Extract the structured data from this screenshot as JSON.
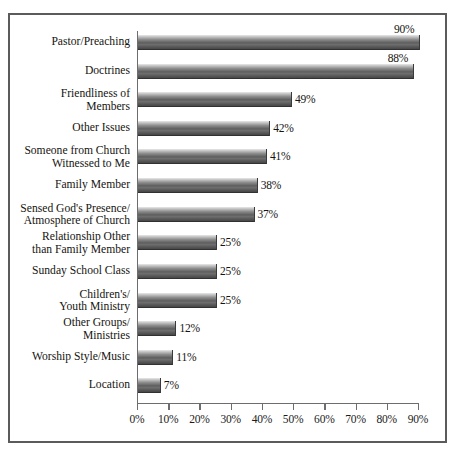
{
  "chart_data": {
    "type": "bar",
    "orientation": "horizontal",
    "title": "",
    "subtitle": "",
    "xlabel": "",
    "ylabel": "",
    "xlim": [
      0,
      90
    ],
    "xticks": [
      0,
      10,
      20,
      30,
      40,
      50,
      60,
      70,
      80,
      90
    ],
    "xticklabels": [
      "0%",
      "10%",
      "20%",
      "30%",
      "40%",
      "50%",
      "60%",
      "70%",
      "80%",
      "90%"
    ],
    "grid": false,
    "legend": null,
    "value_suffix": "%",
    "categories": [
      "Pastor/Preaching",
      "Doctrines",
      "Friendliness of\nMembers",
      "Other Issues",
      "Someone from Church\nWitnessed to Me",
      "Family Member",
      "Sensed God's Presence/\nAtmosphere of Church",
      "Relationship Other\nthan Family Member",
      "Sunday School Class",
      "Children's/\nYouth Ministry",
      "Other Groups/\nMinistries",
      "Worship Style/Music",
      "Location"
    ],
    "values": [
      90,
      88,
      49,
      42,
      41,
      38,
      37,
      25,
      25,
      25,
      12,
      11,
      7
    ],
    "value_labels": [
      "90%",
      "88%",
      "49%",
      "42%",
      "41%",
      "38%",
      "37%",
      "25%",
      "25%",
      "25%",
      "12%",
      "11%",
      "7%"
    ],
    "label_placement": [
      "above",
      "above",
      "right",
      "right",
      "right",
      "right",
      "right",
      "right",
      "right",
      "right",
      "right",
      "right",
      "right"
    ],
    "colors": {
      "bar_light": "#e9e9e9",
      "bar_dark": "#3e3e3e",
      "axis": "#6d6d6d",
      "frame": "#5b5b5b",
      "text": "#15140f",
      "background": "#ffffff"
    }
  }
}
